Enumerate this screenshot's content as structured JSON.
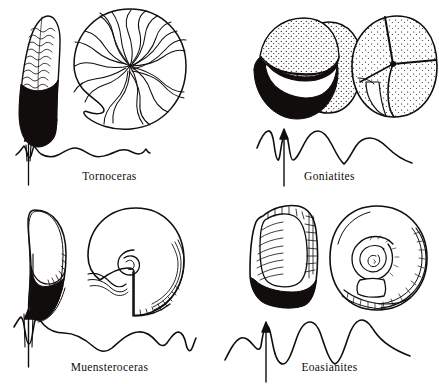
{
  "figure": {
    "background_color": "#ffffff",
    "ink_color": "#100d0c",
    "width": 439,
    "height": 384,
    "layout": "2x2 grid of genus panels"
  },
  "panels": [
    {
      "id": "tornoceras",
      "position": "top-left",
      "caption": "Tornoceras",
      "views": [
        {
          "name": "ventral-view",
          "icon": "ammonoid-ventral-elongate-icon",
          "description": "Elongate ventral view with wavy growth lines in upper half and solid black body chamber in lower half"
        },
        {
          "name": "lateral-view",
          "icon": "ammonoid-coil-swirl-icon",
          "description": "Discoidal coiled shell with radiating S-shaped suture traces converging at the umbilicus"
        }
      ],
      "suture": {
        "name": "suture-line-tornoceras",
        "description": "Simple goniatitic suture: a single sharp ventral lobe beside the arrow, then gentle low-amplitude undulations trailing off",
        "arrow_label": "venter-arrow"
      }
    },
    {
      "id": "goniatites",
      "position": "top-right",
      "caption": "Goniatites",
      "views": [
        {
          "name": "ventral-view",
          "icon": "ammonoid-globose-stippled-icon",
          "description": "Globose stippled shell with broad black aperture band across the lower portion"
        },
        {
          "name": "lateral-view",
          "icon": "ammonoid-globose-involute-icon",
          "description": "Nearly spherical involute shell, stippled, with deep umbilical notch and radial seam"
        }
      ],
      "suture": {
        "name": "suture-line-goniatites",
        "description": "Goniatitic suture with pointed ventral lobe pair at the arrow, a rounded saddle, a deep V lobe and a broad flank saddle",
        "arrow_label": "venter-arrow"
      }
    },
    {
      "id": "muensteroceras",
      "position": "bottom-left",
      "caption": "Muensteroceras",
      "views": [
        {
          "name": "ventral-view",
          "icon": "ammonoid-oval-narrow-icon",
          "description": "Narrow oval ventral view, open white aperture above and solid black filled region below"
        },
        {
          "name": "lateral-view",
          "icon": "ammonoid-coil-involute-icon",
          "description": "Involute coiled shell with small exposed umbilicus and ribbed ventral margin"
        }
      ],
      "suture": {
        "name": "suture-line-muensteroceras",
        "description": "Suture with narrow ventral lobe at the arrow followed by three broad rounded saddles and a narrow terminal lobe",
        "arrow_label": "venter-arrow"
      }
    },
    {
      "id": "eoasianites",
      "position": "bottom-right",
      "caption": "Eoasianites",
      "views": [
        {
          "name": "ventral-view",
          "icon": "ammonoid-barrel-ribbed-icon",
          "description": "Barrel-shaped ventral view with fine transverse ribbing and black basal band"
        },
        {
          "name": "lateral-view",
          "icon": "ammonoid-coil-evolute-icon",
          "description": "Evolute coiled shell showing multiple whorls spiralling to the centre with crenulated outer margin"
        }
      ],
      "suture": {
        "name": "suture-line-eoasianites",
        "description": "Angular goniatitic suture with a sharp ventral lobe at the arrow and two deep pointed lateral lobes between rounded saddles",
        "arrow_label": "venter-arrow"
      }
    }
  ]
}
